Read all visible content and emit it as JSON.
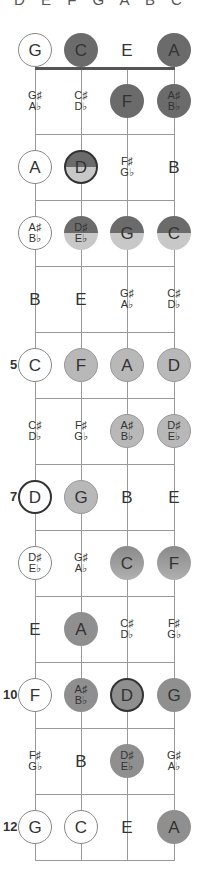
{
  "scale_label": "D E F G A B C",
  "tuning": [
    "G",
    "C",
    "E",
    "A"
  ],
  "strings_x": [
    35,
    81,
    127,
    174
  ],
  "colors": {
    "dark": "#6b6b6b",
    "mid": "#8f8f8f",
    "light": "#b8b8b8",
    "string": "#999999",
    "nut": "#555555"
  },
  "fret_markers": [
    {
      "fret": 5,
      "label": "5"
    },
    {
      "fret": 7,
      "label": "7"
    },
    {
      "fret": 10,
      "label": "10"
    },
    {
      "fret": 12,
      "label": "12"
    }
  ],
  "rows": [
    {
      "fret": 0,
      "notes": [
        {
          "t": "G",
          "s": "outline"
        },
        {
          "t": "C",
          "s": "dark"
        },
        {
          "t": "E",
          "s": "plain"
        },
        {
          "t": "A",
          "s": "dark"
        }
      ]
    },
    {
      "fret": 1,
      "notes": [
        {
          "t": "G♯",
          "b": "A♭",
          "s": "plain"
        },
        {
          "t": "C♯",
          "b": "D♭",
          "s": "plain"
        },
        {
          "t": "F",
          "s": "dark"
        },
        {
          "t": "A♯",
          "b": "B♭",
          "s": "dark"
        }
      ]
    },
    {
      "fret": 2,
      "notes": [
        {
          "t": "A",
          "s": "outline"
        },
        {
          "t": "D",
          "s": "half root"
        },
        {
          "t": "F♯",
          "b": "G♭",
          "s": "plain"
        },
        {
          "t": "B",
          "s": "plain"
        }
      ]
    },
    {
      "fret": 3,
      "notes": [
        {
          "t": "A♯",
          "b": "B♭",
          "s": "outline"
        },
        {
          "t": "D♯",
          "b": "E♭",
          "s": "half"
        },
        {
          "t": "G",
          "s": "half"
        },
        {
          "t": "C",
          "s": "half"
        }
      ]
    },
    {
      "fret": 4,
      "notes": [
        {
          "t": "B",
          "s": "plain"
        },
        {
          "t": "E",
          "s": "plain"
        },
        {
          "t": "G♯",
          "b": "A♭",
          "s": "plain"
        },
        {
          "t": "C♯",
          "b": "D♭",
          "s": "plain"
        }
      ]
    },
    {
      "fret": 5,
      "notes": [
        {
          "t": "C",
          "s": "outline"
        },
        {
          "t": "F",
          "s": "light"
        },
        {
          "t": "A",
          "s": "light"
        },
        {
          "t": "D",
          "s": "light root"
        }
      ]
    },
    {
      "fret": 6,
      "notes": [
        {
          "t": "C♯",
          "b": "D♭",
          "s": "plain"
        },
        {
          "t": "F♯",
          "b": "G♭",
          "s": "plain"
        },
        {
          "t": "A♯",
          "b": "B♭",
          "s": "light"
        },
        {
          "t": "D♯",
          "b": "E♭",
          "s": "light"
        }
      ]
    },
    {
      "fret": 7,
      "notes": [
        {
          "t": "D",
          "s": "root"
        },
        {
          "t": "G",
          "s": "light"
        },
        {
          "t": "B",
          "s": "plain"
        },
        {
          "t": "E",
          "s": "plain"
        }
      ]
    },
    {
      "fret": 8,
      "notes": [
        {
          "t": "D♯",
          "b": "E♭",
          "s": "outline"
        },
        {
          "t": "G♯",
          "b": "A♭",
          "s": "plain"
        },
        {
          "t": "C",
          "s": "grad"
        },
        {
          "t": "F",
          "s": "grad"
        }
      ]
    },
    {
      "fret": 9,
      "notes": [
        {
          "t": "E",
          "s": "plain"
        },
        {
          "t": "A",
          "s": "mid"
        },
        {
          "t": "C♯",
          "b": "D♭",
          "s": "plain"
        },
        {
          "t": "F♯",
          "b": "G♭",
          "s": "plain"
        }
      ]
    },
    {
      "fret": 10,
      "notes": [
        {
          "t": "F",
          "s": "outline"
        },
        {
          "t": "A♯",
          "b": "B♭",
          "s": "mid"
        },
        {
          "t": "D",
          "s": "mid root"
        },
        {
          "t": "G",
          "s": "mid"
        }
      ]
    },
    {
      "fret": 11,
      "notes": [
        {
          "t": "F♯",
          "b": "G♭",
          "s": "plain"
        },
        {
          "t": "B",
          "s": "plain"
        },
        {
          "t": "D♯",
          "b": "E♭",
          "s": "mid"
        },
        {
          "t": "G♯",
          "b": "A♭",
          "s": "plain"
        }
      ]
    },
    {
      "fret": 12,
      "notes": [
        {
          "t": "G",
          "s": "outline"
        },
        {
          "t": "C",
          "s": "outline"
        },
        {
          "t": "E",
          "s": "plain"
        },
        {
          "t": "A",
          "s": "mid"
        }
      ]
    }
  ]
}
